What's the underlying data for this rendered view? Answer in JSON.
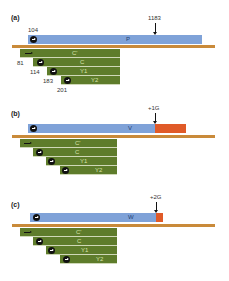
{
  "colors": {
    "transcript_blue": "#7fa2d8",
    "insertion_red": "#e05a28",
    "genome_line": "#c98a3a",
    "fragment_green": "#5e7c2b"
  },
  "panels": [
    {
      "label": "(a)",
      "transcript_label": "P",
      "marker_label": "1183",
      "start_label": "104",
      "insertion": null,
      "fragments": [
        "C'",
        "C",
        "Y1",
        "Y2"
      ],
      "fragment_start_labels": [
        "81",
        "114",
        "183",
        "201"
      ]
    },
    {
      "label": "(b)",
      "transcript_label": "V",
      "marker_label": "+1G",
      "insertion": "long",
      "fragments": [
        "C'",
        "C",
        "Y1",
        "Y2"
      ]
    },
    {
      "label": "(c)",
      "transcript_label": "W",
      "marker_label": "+2G",
      "insertion": "short",
      "fragments": [
        "C'",
        "C",
        "Y1",
        "Y2"
      ]
    }
  ]
}
